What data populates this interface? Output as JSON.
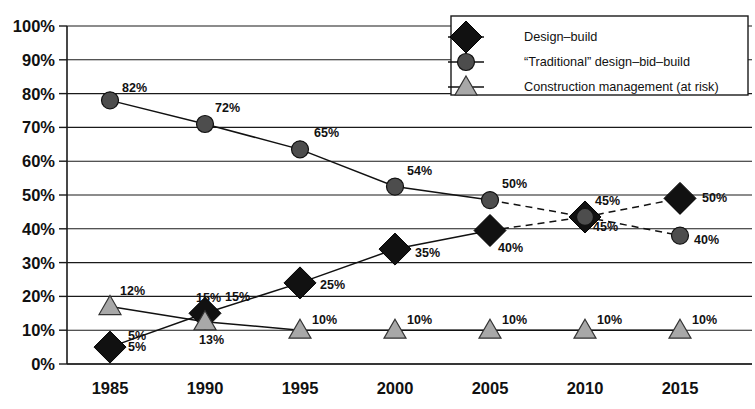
{
  "chart_data": {
    "type": "line",
    "title": "",
    "xlabel": "",
    "ylabel": "",
    "categories": [
      "1985",
      "1990",
      "1995",
      "2000",
      "2005",
      "2010",
      "2015"
    ],
    "ylim": [
      0,
      100
    ],
    "ytick_labels": [
      "0%",
      "10%",
      "20%",
      "30%",
      "40%",
      "50%",
      "60%",
      "70%",
      "80%",
      "90%",
      "100%"
    ],
    "ytick_values": [
      0,
      10,
      20,
      30,
      40,
      50,
      60,
      70,
      80,
      90,
      100
    ],
    "grid": true,
    "legend_position": "top-right",
    "series": [
      {
        "name": "Design–build",
        "marker": "diamond",
        "marker_fill": "#111111",
        "values": [
          5,
          15,
          25,
          35,
          40,
          45,
          50
        ],
        "plot_values": [
          5,
          15,
          24,
          34,
          39.5,
          43.5,
          49
        ],
        "labels": [
          "5%",
          "15%",
          "25%",
          "35%",
          "40%",
          "45%",
          "50%"
        ],
        "dashed_from_index": 4
      },
      {
        "name": "“Traditional” design–bid–build",
        "marker": "circle",
        "marker_fill": "#4d4d4d",
        "values": [
          82,
          72,
          65,
          54,
          50,
          45,
          40
        ],
        "plot_values": [
          78,
          71,
          63.5,
          52.5,
          48.5,
          43.5,
          38
        ],
        "labels": [
          "82%",
          "72%",
          "65%",
          "54%",
          "50%",
          "45%",
          "40%"
        ],
        "dashed_from_index": 4
      },
      {
        "name": "Construction management (at risk)",
        "marker": "triangle",
        "marker_fill": "#a8a8a8",
        "values": [
          12,
          13,
          10,
          10,
          10,
          10,
          10
        ],
        "plot_values": [
          17,
          12.5,
          10,
          10,
          10,
          10,
          10
        ],
        "labels": [
          "12%",
          "13%",
          "10%",
          "10%",
          "10%",
          "10%",
          "10%"
        ],
        "dashed_from_index": -1
      }
    ],
    "extra_labels": [
      {
        "text": "5%",
        "x": 128,
        "y": 340,
        "note": "overlapping duplicate at 1985"
      },
      {
        "text": "15%",
        "x": 196,
        "y": 302,
        "note": "construction-management label at 1990"
      }
    ]
  },
  "legend": {
    "entries": [
      {
        "label": "Design–build",
        "marker": "diamond"
      },
      {
        "label": "“Traditional” design–bid–build",
        "marker": "circle"
      },
      {
        "label": "Construction management (at risk)",
        "marker": "triangle"
      }
    ]
  },
  "colors": {
    "axis": "#1a1a1a",
    "grid": "#1a1a1a",
    "design_build": "#111111",
    "traditional": "#4d4d4d",
    "construction_management": "#a8a8a8",
    "background": "#ffffff"
  }
}
